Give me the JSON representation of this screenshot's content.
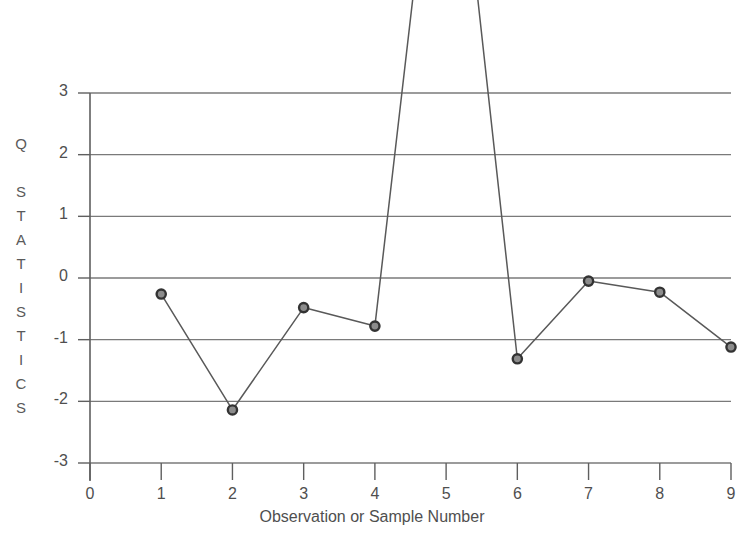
{
  "chart_data": {
    "type": "line",
    "title": "",
    "xlabel": "Observation or Sample Number",
    "ylabel": "Q STATISTICS",
    "ylabel_letters": [
      "Q",
      "",
      "S",
      "T",
      "A",
      "T",
      "I",
      "S",
      "T",
      "I",
      "C",
      "S"
    ],
    "x": [
      1,
      2,
      3,
      4,
      5,
      6,
      7,
      8,
      9
    ],
    "values": [
      -0.26,
      -2.14,
      -0.48,
      -0.78,
      9.2,
      -1.31,
      -0.05,
      -0.23,
      -1.12
    ],
    "series": [
      {
        "name": "Q Statistic",
        "values": [
          -0.26,
          -2.14,
          -0.48,
          -0.78,
          9.2,
          -1.31,
          -0.05,
          -0.23,
          -1.12
        ]
      }
    ],
    "xlim": [
      0,
      9
    ],
    "ylim": [
      -3,
      3
    ],
    "xticks": [
      0,
      1,
      2,
      3,
      4,
      5,
      6,
      7,
      8,
      9
    ],
    "xtick_labels": [
      "0",
      "1",
      "2",
      "3",
      "4",
      "5",
      "6",
      "7",
      "8",
      "9"
    ],
    "yticks": [
      3,
      2,
      1,
      0,
      -1,
      -2,
      -3
    ],
    "ytick_labels": [
      "3",
      "2",
      "1",
      "0",
      "-1",
      "-2",
      "-3"
    ],
    "grid": true,
    "grid_axis": "y",
    "legend": false,
    "legend_position": "none",
    "marker": "circle",
    "clipped_point_note": "value at x=5 extends above the top of the plotted area",
    "colors": {
      "line": "#595959",
      "marker_edge": "#333333",
      "marker_face": "#8c8c8c",
      "grid": "#7a7a7a",
      "axis": "#5f5f5f",
      "text": "#4f4f4f",
      "background": "#ffffff"
    }
  }
}
